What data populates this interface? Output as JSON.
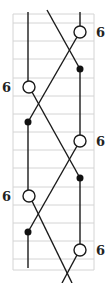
{
  "diagram": {
    "type": "string-diagram",
    "grid": {
      "x_start": 13,
      "x_end": 94,
      "y_top": 14,
      "y_bottom": 270,
      "rows": [
        14,
        23,
        41,
        59,
        78,
        96,
        114,
        132,
        150,
        168,
        187,
        205,
        223,
        241,
        259,
        270
      ],
      "color": "#d4d4d4"
    },
    "strands": [
      {
        "id": "left-top-vertical",
        "points": [
          [
            28,
            12
          ],
          [
            28,
            81
          ]
        ]
      },
      {
        "id": "right-top-vertical",
        "points": [
          [
            80,
            12
          ],
          [
            80,
            26
          ]
        ]
      },
      {
        "id": "top-diagonal-down",
        "points": [
          [
            47,
            10
          ],
          [
            80,
            69
          ]
        ]
      },
      {
        "id": "right-circle1-to-left-dot1",
        "points": [
          [
            77,
            37
          ],
          [
            28,
            122
          ]
        ]
      },
      {
        "id": "right-dot1-to-circle2",
        "points": [
          [
            80,
            69
          ],
          [
            80,
            135
          ]
        ]
      },
      {
        "id": "left-circle1-to-right-dot2",
        "points": [
          [
            32,
            92
          ],
          [
            80,
            178
          ]
        ]
      },
      {
        "id": "left-dot1-to-circle2",
        "points": [
          [
            28,
            122
          ],
          [
            28,
            190
          ]
        ]
      },
      {
        "id": "right-circle2-to-left-dot2",
        "points": [
          [
            77,
            146
          ],
          [
            28,
            232
          ]
        ]
      },
      {
        "id": "right-dot2-to-circle3",
        "points": [
          [
            80,
            178
          ],
          [
            80,
            244
          ]
        ]
      },
      {
        "id": "left-circle2-to-bottom",
        "points": [
          [
            32,
            201
          ],
          [
            72,
            283
          ]
        ]
      },
      {
        "id": "left-dot2-to-bottom",
        "points": [
          [
            28,
            232
          ],
          [
            28,
            268
          ]
        ]
      },
      {
        "id": "right-circle3-to-bottom",
        "points": [
          [
            77,
            255
          ],
          [
            62,
            283
          ]
        ]
      }
    ],
    "open_nodes": [
      {
        "cx": 80,
        "cy": 32,
        "r": 6
      },
      {
        "cx": 29,
        "cy": 87,
        "r": 6
      },
      {
        "cx": 80,
        "cy": 141,
        "r": 6
      },
      {
        "cx": 29,
        "cy": 196,
        "r": 6
      },
      {
        "cx": 80,
        "cy": 250,
        "r": 6
      }
    ],
    "filled_nodes": [
      {
        "cx": 80,
        "cy": 69,
        "r": 3.5
      },
      {
        "cx": 28,
        "cy": 122,
        "r": 3.5
      },
      {
        "cx": 80,
        "cy": 178,
        "r": 3.5
      },
      {
        "cx": 28,
        "cy": 232,
        "r": 3.5
      }
    ],
    "labels": [
      {
        "text": "6",
        "x": 96,
        "y": 37
      },
      {
        "text": "6",
        "x": 2,
        "y": 92
      },
      {
        "text": "6",
        "x": 96,
        "y": 146
      },
      {
        "text": "6",
        "x": 2,
        "y": 201
      },
      {
        "text": "6",
        "x": 96,
        "y": 255
      }
    ]
  }
}
